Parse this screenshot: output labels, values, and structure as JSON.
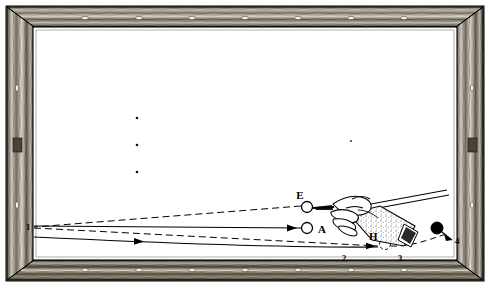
{
  "figure": {
    "kind": "billiard-table-diagram",
    "title": "",
    "frame": {
      "wood_color_light": "#cfc8bd",
      "wood_color_dark": "#3a342c",
      "outer": {
        "x": 6,
        "y": 6,
        "w": 478,
        "h": 275
      },
      "inner_cloth": {
        "x": 33,
        "y": 27,
        "w": 424,
        "h": 233
      },
      "cloth_color": "#ffffff",
      "rail_stroke": "#111111"
    },
    "pockets_top": [
      85,
      139,
      192,
      245,
      298,
      351,
      404
    ],
    "pockets_bottom": [
      85,
      139,
      192,
      245,
      298,
      351,
      404
    ],
    "pockets_left": [
      88,
      146,
      205
    ],
    "pockets_right": [
      88,
      146,
      205
    ],
    "balls": [
      {
        "id": "E",
        "label": "E",
        "cx": 307,
        "cy": 207,
        "r": 5.5,
        "fill": "#ffffff",
        "stroke": "#000000",
        "label_x": 302,
        "label_y": 198
      },
      {
        "id": "A",
        "label": "A",
        "cx": 307,
        "cy": 228,
        "r": 5.5,
        "fill": "#ffffff",
        "stroke": "#000000",
        "label_x": 317,
        "label_y": 233
      },
      {
        "id": "black",
        "label": "",
        "cx": 437,
        "cy": 228,
        "r": 6,
        "fill": "#000000",
        "stroke": "#000000",
        "label_x": 0,
        "label_y": 0
      },
      {
        "id": "H",
        "label": "H",
        "cx": 385,
        "cy": 244,
        "r": 5.5,
        "fill": "none",
        "stroke": "#000000",
        "label_x": 370,
        "label_y": 238
      }
    ],
    "cushion_numbers": [
      {
        "text": "1",
        "x": 28,
        "y": 228
      },
      {
        "text": "2",
        "x": 344,
        "y": 260
      },
      {
        "text": "3",
        "x": 400,
        "y": 260
      },
      {
        "text": "4",
        "x": 456,
        "y": 243
      }
    ],
    "spots": [
      {
        "cx": 137,
        "cy": 118,
        "r": 1.3
      },
      {
        "cx": 137,
        "cy": 145,
        "r": 1.3
      },
      {
        "cx": 137,
        "cy": 172,
        "r": 1.3
      },
      {
        "cx": 351,
        "cy": 141,
        "r": 1.1
      }
    ],
    "trajectories": [
      {
        "name": "cue-to-cushion-1-dashed",
        "style": "dashed",
        "points": "307,207 34,227"
      },
      {
        "name": "cushion-1-to-H-dashed",
        "style": "dashed",
        "points": "34,227 382,245"
      },
      {
        "name": "H-to-ball-4-dashed",
        "style": "dashed",
        "points": "389,245 449,234"
      },
      {
        "name": "object-ball-path-solid",
        "style": "solid",
        "points": "301,228 34,227"
      },
      {
        "name": "lower-return-solid",
        "style": "solid",
        "points": "34,237 380,247"
      }
    ],
    "arrows": [
      {
        "name": "arrow-to-ball-A",
        "x": 290,
        "y": 228,
        "angle": 182
      },
      {
        "name": "arrow-lower-path",
        "x": 140,
        "y": 241,
        "angle": 2
      },
      {
        "name": "arrow-near-H",
        "x": 372,
        "y": 246,
        "angle": 6
      },
      {
        "name": "arrow-to-black-ball",
        "x": 447,
        "y": 236,
        "angle": 228
      }
    ],
    "cue": {
      "name": "cue-stick-with-hand",
      "shaft_points": "352,209 444,192",
      "butt_points": "356,216 447,196",
      "grip_x": 356,
      "grip_y": 208
    }
  }
}
